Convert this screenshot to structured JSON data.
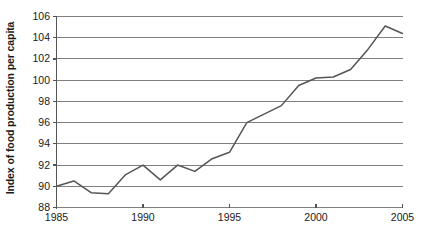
{
  "chart_data": {
    "type": "line",
    "title": "",
    "xlabel": "",
    "ylabel": "Index of food production per capita",
    "xlim": [
      1985,
      2005
    ],
    "ylim": [
      88,
      106
    ],
    "grid": true,
    "legend": "none",
    "x_tick_labels": [
      "1985",
      "1990",
      "1995",
      "2000",
      "2005"
    ],
    "x_ticks": [
      1985,
      1990,
      1995,
      2000,
      2005
    ],
    "y_tick_labels": [
      "88",
      "90",
      "92",
      "94",
      "96",
      "98",
      "100",
      "102",
      "104",
      "106"
    ],
    "y_ticks": [
      88,
      90,
      92,
      94,
      96,
      98,
      100,
      102,
      104,
      106
    ],
    "line_color": "#555555",
    "grid_color": "#808080",
    "axis_color": "#555555",
    "x": [
      1985,
      1986,
      1987,
      1988,
      1989,
      1990,
      1991,
      1992,
      1993,
      1994,
      1995,
      1996,
      1997,
      1998,
      1999,
      2000,
      2001,
      2002,
      2003,
      2004,
      2005
    ],
    "values": [
      90.0,
      90.5,
      89.4,
      89.3,
      91.1,
      92.0,
      90.6,
      92.0,
      91.4,
      92.6,
      93.2,
      96.0,
      96.8,
      97.6,
      99.5,
      100.2,
      100.3,
      101.0,
      102.9,
      105.1,
      104.4
    ],
    "series": [
      {
        "name": "Index of food production per capita",
        "values": [
          90.0,
          90.5,
          89.4,
          89.3,
          91.1,
          92.0,
          90.6,
          92.0,
          91.4,
          92.6,
          93.2,
          96.0,
          96.8,
          97.6,
          99.5,
          100.2,
          100.3,
          101.0,
          102.9,
          105.1,
          104.4
        ]
      }
    ]
  }
}
